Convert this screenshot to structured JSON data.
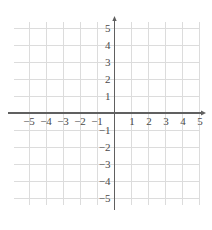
{
  "chart_data": {
    "type": "scatter",
    "title": "",
    "subtitle": "",
    "xlabel": "",
    "ylabel": "",
    "xlim": [
      -5.9,
      5.0
    ],
    "ylim": [
      -5.35,
      5.35
    ],
    "grid": true,
    "legend": null,
    "series": [],
    "annotations": [],
    "x_tick_labels": [
      "−5",
      "−4",
      "−3",
      "−2",
      "−1",
      "1",
      "2",
      "3",
      "4",
      "5"
    ],
    "x_tick_values": [
      -5,
      -4,
      -3,
      -2,
      -1,
      1,
      2,
      3,
      4,
      5
    ],
    "y_tick_labels": [
      "5",
      "4",
      "3",
      "2",
      "1",
      "−1",
      "−2",
      "−3",
      "−4",
      "−5"
    ],
    "y_tick_values": [
      5,
      4,
      3,
      2,
      1,
      -1,
      -2,
      -3,
      -4,
      -5
    ],
    "origin_label": "",
    "x_axis_arrow": true,
    "y_axis_arrow": true,
    "colors": {
      "background": "#ffffff",
      "grid": "#dcdcdc",
      "axis": "#606060",
      "label": "#4a4a4a"
    }
  },
  "geometry": {
    "width": 212,
    "height": 230,
    "origin_x": 114.5,
    "origin_y": 113,
    "unit_px": 17,
    "grid_x_min": 14,
    "grid_x_max": 200,
    "grid_y_min": 22,
    "grid_y_max": 205,
    "axis_x_start": 8,
    "axis_x_end": 206,
    "axis_y_start": 16,
    "axis_y_end": 210
  }
}
